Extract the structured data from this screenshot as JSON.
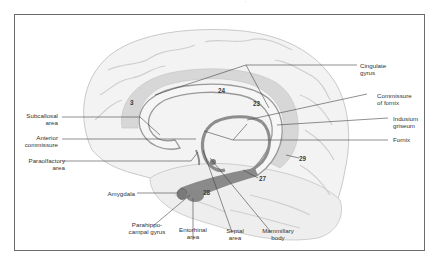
{
  "figure": {
    "type": "medial view of cerebral hemisphere — limbic system",
    "colors": {
      "frame": "#6b6b6b",
      "brain_fill": "#f1f1f1",
      "gyri_lines": "#c4c4c4",
      "limbic_band": "#d2d2d2",
      "fornix": "#8d8d8d",
      "leader_lines": "#444444",
      "text": "#333333"
    }
  },
  "labels": {
    "cingulate_gyrus": "Cingulate\ngyrus",
    "commissure_of_fornix": "Commissure\nof fornix",
    "indusium_griseum": "Indusium\ngriseum",
    "fornix": "Fornix",
    "subcallosal_area": "Subcallosal\narea",
    "anterior_commissure": "Anterior\ncommissure",
    "paraolfactory_area": "Paraolfactory\narea",
    "amygdala": "Amygdala",
    "parahippocampal_gyrus": "Parahippo-\ncampal gyrus",
    "entorhinal_area": "Entorhinal\narea",
    "septal_area": "Septal\narea",
    "mammillary_body": "Mammillary\nbody"
  },
  "areas": {
    "a3": "3",
    "a24": "24",
    "a23": "23",
    "a29": "29",
    "a27": "27",
    "a28": "28"
  }
}
